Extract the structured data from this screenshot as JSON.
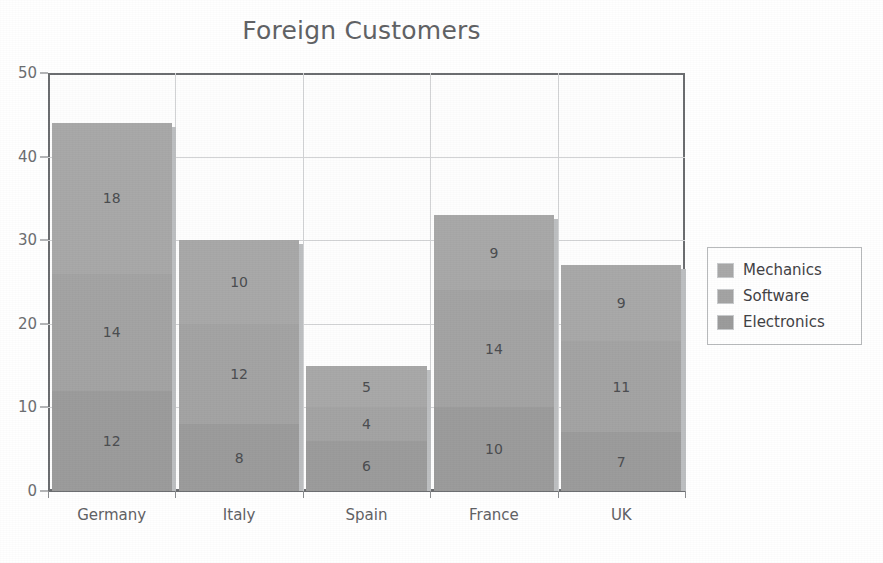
{
  "chart_data": {
    "type": "bar",
    "subtype": "stacked-vertical",
    "title": "Foreign Customers",
    "xlabel": "",
    "ylabel": "",
    "categories": [
      "Germany",
      "Italy",
      "Spain",
      "France",
      "UK"
    ],
    "series": [
      {
        "name": "Electronics",
        "values": [
          12,
          8,
          6,
          10,
          7
        ],
        "color": "#9b9b9b",
        "stack_order": 0
      },
      {
        "name": "Software",
        "values": [
          14,
          12,
          4,
          14,
          11
        ],
        "color": "#a3a3a3",
        "stack_order": 1
      },
      {
        "name": "Mechanics",
        "values": [
          18,
          10,
          5,
          9,
          9
        ],
        "color": "#a8a8a8",
        "stack_order": 2
      }
    ],
    "totals": [
      44,
      30,
      15,
      33,
      27
    ],
    "ylim": [
      0,
      50
    ],
    "yticks": [
      0,
      10,
      20,
      30,
      40,
      50
    ],
    "ytick_labels": [
      "0",
      "10",
      "20",
      "30",
      "40",
      "50"
    ],
    "grid": {
      "horizontal": true,
      "vertical": true,
      "color": "#d2d3d5"
    },
    "legend": {
      "position": "right",
      "entries": [
        "Mechanics",
        "Software",
        "Electronics"
      ]
    },
    "data_labels": true
  },
  "legend": {
    "items": [
      {
        "label": "Mechanics",
        "color": "#a8a8a8"
      },
      {
        "label": "Software",
        "color": "#a3a3a3"
      },
      {
        "label": "Electronics",
        "color": "#9b9b9b"
      }
    ]
  },
  "axes": {
    "y": {
      "ticks": [
        "0",
        "10",
        "20",
        "30",
        "40",
        "50"
      ]
    },
    "x": {
      "ticks": [
        "Germany",
        "Italy",
        "Spain",
        "France",
        "UK"
      ]
    }
  },
  "colors": {
    "axis": "#6b6d70",
    "grid": "#d2d3d5",
    "title": "#5f6164",
    "label": "#4a4c4f",
    "plot_background": "#fefefe"
  }
}
